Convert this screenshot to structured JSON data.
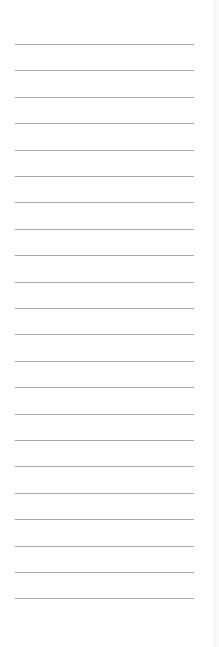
{
  "panel": {
    "line_count": 22,
    "first_line_y": 44,
    "line_spacing": 26.4,
    "line_color": "#a8a8a8",
    "border_color": "#ececec"
  }
}
